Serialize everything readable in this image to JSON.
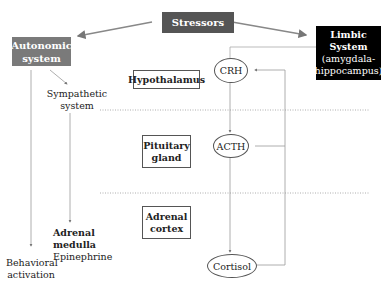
{
  "diagram": {
    "stressors": {
      "label": "Stressors",
      "color": "#555555"
    },
    "autonomic": {
      "line1": "Autonomic",
      "line2": "system",
      "color": "#7a7a7a"
    },
    "limbic": {
      "line1": "Limbic",
      "line2": "System",
      "line3": "(amygdala-",
      "line4": "hippocampus)",
      "color": "#000000"
    },
    "sympathetic": {
      "line1": "Sympathetic",
      "line2": "system"
    },
    "regions": {
      "hypothalamus": "Hypothalamus",
      "pituitary": {
        "line1": "Pituitary",
        "line2": "gland"
      },
      "adrenal_cortex": {
        "line1": "Adrenal",
        "line2": "cortex"
      }
    },
    "hormones": {
      "crh": "CRH",
      "acth": "ACTH",
      "cortisol": "Cortisol"
    },
    "adrenal_medulla": {
      "line1": "Adrenal",
      "line2": "medulla",
      "line3": "Epinephrine"
    },
    "behavioral": {
      "line1": "Behavioral",
      "line2": "activation"
    }
  }
}
